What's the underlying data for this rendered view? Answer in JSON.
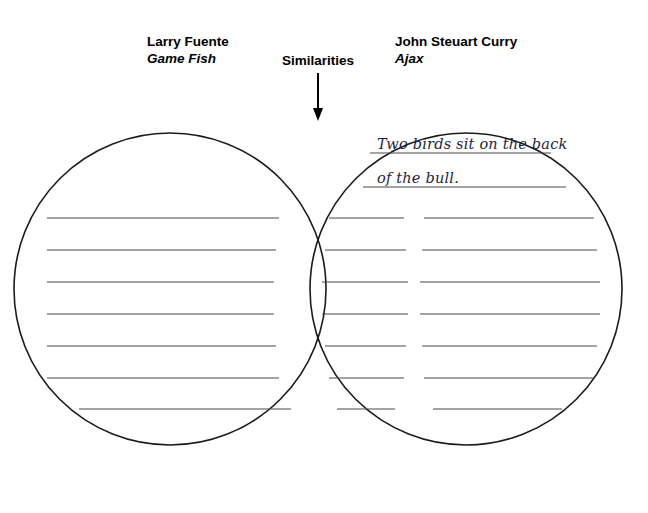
{
  "page": {
    "background_color": "#ffffff",
    "width": 648,
    "height": 513,
    "ink_color": "#1a1a1a",
    "rule_color": "#4a4a4a",
    "handwriting_color": "#1f1f3d"
  },
  "headers": {
    "left": {
      "artist": "Larry Fuente",
      "artwork": "Game Fish"
    },
    "middle": {
      "label": "Similarities"
    },
    "right": {
      "artist": "John Steuart Curry",
      "artwork": "Ajax"
    }
  },
  "annotations": {
    "arrow_target": "overlap-region"
  },
  "right_circle_entries": [
    "Two birds sit on the back",
    "of the bull."
  ],
  "left_circle_entries": [],
  "overlap_entries": [],
  "rule_rows": [
    {
      "y": 218,
      "left": [
        47,
        279
      ],
      "center": [
        329,
        404
      ],
      "right": [
        424,
        594
      ]
    },
    {
      "y": 250,
      "left": [
        47,
        276
      ],
      "center": [
        325,
        406
      ],
      "right": [
        422,
        597
      ]
    },
    {
      "y": 282,
      "left": [
        47,
        274
      ],
      "center": [
        322,
        408
      ],
      "right": [
        420,
        600
      ]
    },
    {
      "y": 314,
      "left": [
        47,
        274
      ],
      "center": [
        322,
        408
      ],
      "right": [
        420,
        600
      ]
    },
    {
      "y": 346,
      "left": [
        47,
        276
      ],
      "center": [
        325,
        406
      ],
      "right": [
        422,
        597
      ]
    },
    {
      "y": 378,
      "left": [
        47,
        279
      ],
      "center": [
        329,
        404
      ],
      "right": [
        424,
        594
      ]
    },
    {
      "y": 409,
      "left": [
        79,
        291
      ],
      "center": [
        337,
        395
      ],
      "right": [
        433,
        562
      ]
    }
  ],
  "right_only_rule_rows": [
    {
      "y": 153,
      "x1": 370,
      "x2": 551
    },
    {
      "y": 187,
      "x1": 363,
      "x2": 566
    }
  ],
  "circles": {
    "left": {
      "cx": 170,
      "cy": 289,
      "r": 156
    },
    "right": {
      "cx": 466,
      "cy": 289,
      "r": 156
    }
  }
}
